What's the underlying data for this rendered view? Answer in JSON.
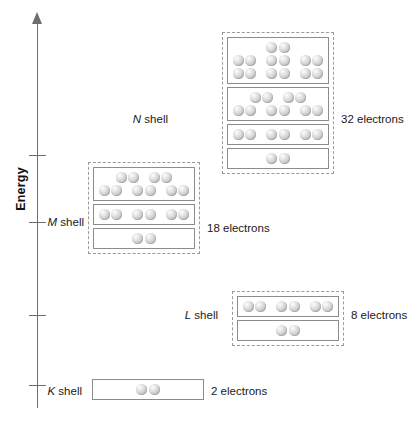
{
  "axis": {
    "title": "Energy",
    "tick_count": 4
  },
  "shells": [
    {
      "id": "n-shell",
      "letter": "N",
      "label_suffix": " shell",
      "count_label": "32 electrons",
      "total_electrons": 32,
      "dashed_container": true,
      "subshells": [
        {
          "rows": [
            2,
            6,
            6
          ]
        },
        {
          "rows": [
            4,
            6
          ]
        },
        {
          "rows": [
            6
          ]
        },
        {
          "rows": [
            2
          ]
        }
      ]
    },
    {
      "id": "m-shell",
      "letter": "M",
      "label_suffix": " shell",
      "count_label": "18 electrons",
      "total_electrons": 18,
      "dashed_container": true,
      "subshells": [
        {
          "rows": [
            4,
            6
          ]
        },
        {
          "rows": [
            6
          ]
        },
        {
          "rows": [
            2
          ]
        }
      ]
    },
    {
      "id": "l-shell",
      "letter": "L",
      "label_suffix": " shell",
      "count_label": "8 electrons",
      "total_electrons": 8,
      "dashed_container": true,
      "subshells": [
        {
          "rows": [
            6
          ]
        },
        {
          "rows": [
            2
          ]
        }
      ]
    },
    {
      "id": "k-shell",
      "letter": "K",
      "label_suffix": " shell",
      "count_label": "2 electrons",
      "total_electrons": 2,
      "dashed_container": false,
      "subshells": [
        {
          "rows": [
            2
          ]
        }
      ]
    }
  ],
  "colors": {
    "axis": "#6e6e6e",
    "box_border": "#8c8c8c",
    "dashed_border": "#9a9a9a",
    "text": "#1a1a1a",
    "background": "#ffffff"
  }
}
